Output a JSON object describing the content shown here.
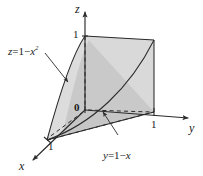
{
  "figure": {
    "type": "3d-solid-diagram",
    "background_color": "#ffffff",
    "stroke_color": "#2b2b2b",
    "surface_front_color": "#cfcfcf",
    "surface_side_color": "#bdbdbd",
    "surface_top_color": "#d8d8d8",
    "base_color": "#c4c4c4"
  },
  "axes": {
    "z": {
      "name": "z",
      "tick_label": "1"
    },
    "y": {
      "name": "y",
      "tick_label": "1"
    },
    "x": {
      "name": "x",
      "tick_label": "1"
    },
    "origin_label": "0"
  },
  "annotations": [
    {
      "id": "parabolic-cylinder",
      "lhs": "z",
      "eq": "=",
      "rhs_a": "1",
      "minus": "−",
      "rhs_var": "x",
      "rhs_exp": "2",
      "full_text": "z = 1 − x²"
    },
    {
      "id": "plane",
      "lhs": "y",
      "eq": "=",
      "rhs_a": "1",
      "minus": "−",
      "rhs_var": "x",
      "rhs_exp": "",
      "full_text": "y = 1 − x"
    }
  ]
}
